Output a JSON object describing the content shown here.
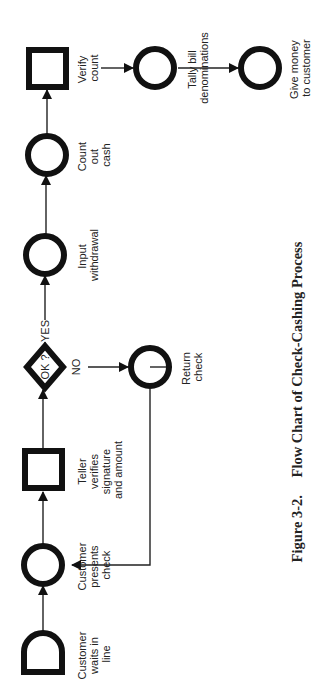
{
  "figure": {
    "caption_number": "Figure 3-2.",
    "caption_title": "Flow Chart of Check-Cashing Process"
  },
  "nodes": [
    {
      "id": "wait",
      "shape": "delay",
      "lines": [
        "Customer",
        "waits in",
        "line"
      ]
    },
    {
      "id": "present",
      "shape": "operation",
      "lines": [
        "Customer",
        "presents",
        "check"
      ]
    },
    {
      "id": "verify_sig",
      "shape": "inspection",
      "lines": [
        "Teller",
        "verifies",
        "signature",
        "and amount"
      ]
    },
    {
      "id": "ok",
      "shape": "decision",
      "text": "OK ?"
    },
    {
      "id": "input",
      "shape": "operation",
      "lines": [
        "Input",
        "withdrawal"
      ]
    },
    {
      "id": "count",
      "shape": "operation",
      "lines": [
        "Count",
        "out",
        "cash"
      ]
    },
    {
      "id": "verify_count",
      "shape": "inspection",
      "lines": [
        "Verify",
        "count"
      ]
    },
    {
      "id": "return",
      "shape": "operation",
      "lines": [
        "Return",
        "check"
      ]
    },
    {
      "id": "tally",
      "shape": "operation",
      "lines": [
        "Tally bill",
        "denominations"
      ]
    },
    {
      "id": "give",
      "shape": "operation",
      "lines": [
        "Give money",
        "to customer"
      ]
    }
  ],
  "edges": [
    {
      "from": "wait",
      "to": "present"
    },
    {
      "from": "present",
      "to": "verify_sig"
    },
    {
      "from": "verify_sig",
      "to": "ok"
    },
    {
      "from": "ok",
      "to": "input",
      "label": "YES"
    },
    {
      "from": "ok",
      "to": "return",
      "label": "NO"
    },
    {
      "from": "input",
      "to": "count"
    },
    {
      "from": "count",
      "to": "verify_count"
    },
    {
      "from": "verify_count",
      "to": "tally"
    },
    {
      "from": "tally",
      "to": "give"
    },
    {
      "from": "return",
      "to": "present"
    }
  ],
  "colors": {
    "stroke": "#111111",
    "text": "#222222",
    "background": "#ffffff"
  }
}
